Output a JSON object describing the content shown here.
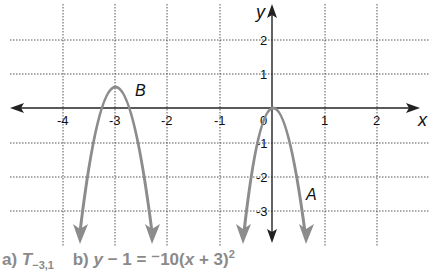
{
  "figure": {
    "axes": {
      "x_label": "x",
      "y_label": "y",
      "x_ticks": [
        "-4",
        "-3",
        "-2",
        "-1",
        "0",
        "1",
        "2"
      ],
      "y_ticks_positive": [
        "2",
        "1"
      ],
      "y_ticks_negative": [
        "-1",
        "-2",
        "-3"
      ]
    },
    "curves": {
      "A": {
        "label": "A",
        "color": "#8c8c8c",
        "vertex": [
          0,
          0
        ]
      },
      "B": {
        "label": "B",
        "color": "#8c8c8c",
        "vertex": [
          -3,
          1
        ]
      }
    }
  },
  "captions": {
    "a_prefix": "a)",
    "a_symbol": "T",
    "a_subscript": "−3,1",
    "b_prefix": "b)",
    "b_equation_lhs": "y − 1 = ",
    "b_equation_rhs_before_x": "⁻10(",
    "b_equation_x": "x",
    "b_equation_rhs_after_x": " + 3)",
    "b_exponent": "2"
  }
}
